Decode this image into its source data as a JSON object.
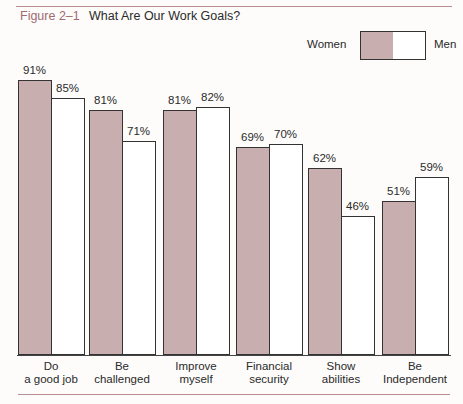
{
  "figure": {
    "number": "Figure 2–1",
    "title": "What Are Our Work Goals?"
  },
  "legend": {
    "women_label": "Women",
    "men_label": "Men",
    "women_color": "#c9aeb0",
    "men_color": "#ffffff"
  },
  "chart_data": {
    "type": "bar",
    "title": "What Are Our Work Goals?",
    "xlabel": "",
    "ylabel": "",
    "ylim": [
      0,
      100
    ],
    "grid": false,
    "legend_position": "top-right",
    "categories": [
      "Do a good job",
      "Be challenged",
      "Improve myself",
      "Financial security",
      "Show abilities",
      "Be Independent"
    ],
    "category_lines": [
      [
        "Do",
        "a good job"
      ],
      [
        "Be",
        "challenged"
      ],
      [
        "Improve",
        "myself"
      ],
      [
        "Financial",
        "security"
      ],
      [
        "Show",
        "abilities"
      ],
      [
        "Be",
        "Independent"
      ]
    ],
    "series": [
      {
        "name": "Women",
        "color": "#c9aeb0",
        "values": [
          91,
          81,
          81,
          69,
          62,
          51
        ],
        "labels": [
          "91%",
          "81%",
          "81%",
          "69%",
          "62%",
          "51%"
        ]
      },
      {
        "name": "Men",
        "color": "#ffffff",
        "values": [
          85,
          71,
          82,
          70,
          46,
          59
        ],
        "labels": [
          "85%",
          "71%",
          "82%",
          "70%",
          "46%",
          "59%"
        ]
      }
    ]
  }
}
